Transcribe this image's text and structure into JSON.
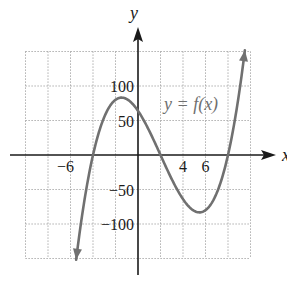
{
  "chart_data": {
    "type": "line",
    "title": "",
    "xlabel": "x",
    "ylabel": "y",
    "xlim": [
      -10,
      10
    ],
    "ylim": [
      -150,
      150
    ],
    "grid": true,
    "grid_x_step": 2,
    "grid_y_step": 50,
    "x_tick_labels": [
      {
        "value": -6,
        "label": "−6"
      },
      {
        "value": 4,
        "label": "4"
      },
      {
        "value": 6,
        "label": "6"
      }
    ],
    "y_tick_labels": [
      {
        "value": 100,
        "label": "100"
      },
      {
        "value": 50,
        "label": "50"
      },
      {
        "value": -50,
        "label": "−50"
      },
      {
        "value": -100,
        "label": "−100"
      }
    ],
    "series": [
      {
        "name": "y = f(x)",
        "color": "#707070",
        "formula": "(x+4)(x-2)(x-8)",
        "x_range": [
          -5.5,
          9.5
        ],
        "roots": [
          -4,
          2,
          8
        ],
        "local_max": {
          "x": -1.46,
          "y": 83
        },
        "local_min": {
          "x": 5.46,
          "y": -83
        },
        "y_intercept": 64,
        "x": [
          -5.5,
          -5,
          -4,
          -3,
          -2,
          -1.46,
          -1,
          0,
          1,
          2,
          3,
          4,
          5,
          5.46,
          6,
          7,
          8,
          9,
          9.5
        ],
        "values": [
          -151.9,
          -117,
          0,
          55,
          80,
          83.1,
          81,
          64,
          35,
          0,
          -35,
          -64,
          -81,
          -83.1,
          -80,
          -55,
          0,
          91,
          151.9
        ]
      }
    ],
    "annotations": [
      {
        "text": "y = f(x)",
        "x": 5.5,
        "y": 70
      }
    ]
  },
  "labels": {
    "x_axis": "x",
    "y_axis": "y",
    "curve": "y = f(x)"
  },
  "colors": {
    "axis": "#1a1a1a",
    "grid": "#9a9a9a",
    "curve": "#707070",
    "curve_label": "#6f6f6f"
  }
}
